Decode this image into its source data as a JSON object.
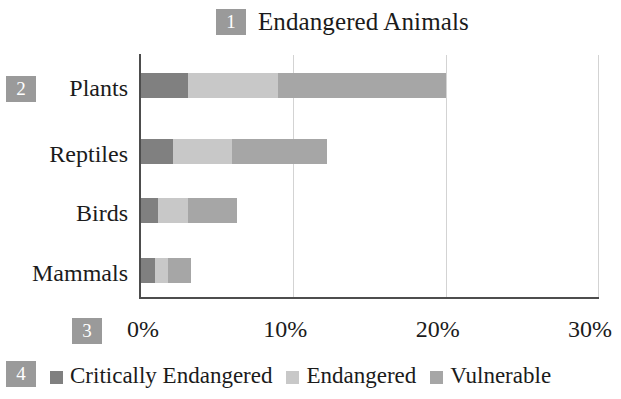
{
  "chart_data": {
    "type": "bar",
    "orientation": "horizontal",
    "stacked": true,
    "title": "Endangered Animals",
    "xlabel": "",
    "ylabel": "",
    "categories": [
      "Plants",
      "Reptiles",
      "Birds",
      "Mammals"
    ],
    "series": [
      {
        "name": "Critically Endangered",
        "color": "#808080",
        "values": [
          3.1,
          2.1,
          1.1,
          0.9
        ]
      },
      {
        "name": "Endangered",
        "color": "#c8c8c8",
        "values": [
          5.9,
          3.9,
          2.0,
          0.9
        ]
      },
      {
        "name": "Vulnerable",
        "color": "#a6a6a6",
        "values": [
          11.0,
          6.2,
          3.2,
          1.5
        ]
      }
    ],
    "totals": [
      20.0,
      12.2,
      6.3,
      3.3
    ],
    "xlim": [
      0,
      30
    ],
    "xticks": [
      0,
      10,
      20,
      30
    ],
    "xtick_labels": [
      "0%",
      "10%",
      "20%",
      "30%"
    ],
    "grid": "vertical",
    "legend_position": "bottom"
  },
  "title": {
    "text": "Endangered Animals"
  },
  "markers": {
    "title_marker": "1",
    "category_axis_marker": "2",
    "value_axis_marker": "3",
    "legend_marker": "4"
  },
  "axis": {
    "category_labels": [
      "Plants",
      "Reptiles",
      "Birds",
      "Mammals"
    ],
    "value_labels": [
      "0%",
      "10%",
      "20%",
      "30%"
    ]
  },
  "legend": {
    "items": [
      {
        "label": "Critically Endangered",
        "color": "#808080"
      },
      {
        "label": "Endangered",
        "color": "#c8c8c8"
      },
      {
        "label": "Vulnerable",
        "color": "#a6a6a6"
      }
    ]
  },
  "colors": {
    "critically_endangered": "#808080",
    "endangered": "#c8c8c8",
    "vulnerable": "#a6a6a6",
    "marker_badge": "#9a9a9a",
    "axis_line": "#4d4d4d",
    "gridline": "#d3d3d3",
    "background": "#ffffff"
  }
}
